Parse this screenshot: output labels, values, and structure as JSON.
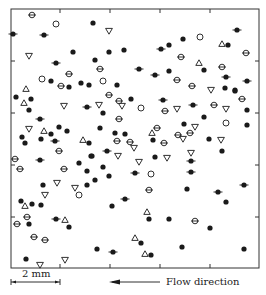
{
  "figure": {
    "scale_bar_label": "2 mm",
    "flow_label": "Flow direction",
    "legend": [
      {
        "marker": "filled-circle",
        "meaning": "filled dot"
      },
      {
        "marker": "filled-circle-dash",
        "meaning": "filled dot with horizontal dash"
      },
      {
        "marker": "circled-dot",
        "meaning": "circle with horizontal bar"
      },
      {
        "marker": "open-circle",
        "meaning": "open circle"
      },
      {
        "marker": "triangle-up",
        "meaning": "open upward triangle"
      },
      {
        "marker": "triangle-down",
        "meaning": "open downward triangle"
      }
    ],
    "colors": {
      "ink": "#1a1a1a",
      "frame": "#333333",
      "background": "#ffffff"
    }
  },
  "chart_data": {
    "type": "scatter",
    "title": "",
    "xlabel": "",
    "ylabel": "",
    "frame_px": {
      "left": 11,
      "top": 9,
      "right": 259,
      "bottom": 268
    },
    "x_ticks_px": [
      60,
      110,
      160,
      210
    ],
    "y_ticks_px": [
      61,
      113,
      165,
      217
    ],
    "grid": false,
    "scale": {
      "label": "2 mm",
      "x_start_px": 11,
      "x_end_px": 60
    },
    "annotation": {
      "text": "Flow direction",
      "arrow": "left"
    },
    "series": [
      {
        "name": "filled",
        "marker": "filled-circle",
        "points": [
          [
            93,
            23
          ],
          [
            73,
            52
          ],
          [
            51,
            81
          ],
          [
            69,
            87
          ],
          [
            81,
            83
          ],
          [
            89,
            85
          ],
          [
            109,
            52
          ],
          [
            124,
            50
          ],
          [
            169,
            45
          ],
          [
            95,
            60
          ],
          [
            169,
            71
          ],
          [
            117,
            85
          ],
          [
            183,
            39
          ],
          [
            228,
            45
          ],
          [
            204,
            70
          ],
          [
            225,
            88
          ],
          [
            235,
            90
          ],
          [
            16,
            97
          ],
          [
            31,
            99
          ],
          [
            29,
            110
          ],
          [
            59,
            127
          ],
          [
            67,
            131
          ],
          [
            51,
            134
          ],
          [
            22,
            137
          ],
          [
            41,
            139
          ],
          [
            25,
            143
          ],
          [
            89,
            143
          ],
          [
            91,
            156
          ],
          [
            79,
            163
          ],
          [
            87,
            171
          ],
          [
            131,
            99
          ],
          [
            103,
            113
          ],
          [
            100,
            128
          ],
          [
            115,
            133
          ],
          [
            125,
            134
          ],
          [
            153,
            140
          ],
          [
            92,
            156
          ],
          [
            155,
            157
          ],
          [
            103,
            167
          ],
          [
            109,
            176
          ],
          [
            235,
            91
          ],
          [
            247,
            110
          ],
          [
            204,
            117
          ],
          [
            184,
            124
          ],
          [
            247,
            125
          ],
          [
            209,
            139
          ],
          [
            222,
            151
          ],
          [
            43,
            185
          ],
          [
            87,
            185
          ],
          [
            21,
            201
          ],
          [
            32,
            204
          ],
          [
            41,
            205
          ],
          [
            29,
            224
          ],
          [
            69,
            227
          ],
          [
            26,
            259
          ],
          [
            95,
            180
          ],
          [
            112,
            206
          ],
          [
            149,
            219
          ],
          [
            169,
            219
          ],
          [
            141,
            243
          ],
          [
            97,
            249
          ],
          [
            151,
            255
          ],
          [
            187,
            189
          ],
          [
            226,
            202
          ],
          [
            210,
            228
          ],
          [
            182,
            247
          ],
          [
            244,
            249
          ]
        ]
      },
      {
        "name": "filled-dash",
        "marker": "filled-circle-dash",
        "points": [
          [
            13,
            34
          ],
          [
            44,
            35
          ],
          [
            56,
            63
          ],
          [
            161,
            49
          ],
          [
            139,
            69
          ],
          [
            155,
            75
          ],
          [
            237,
            30
          ],
          [
            226,
            77
          ],
          [
            247,
            81
          ],
          [
            87,
            107
          ],
          [
            40,
            119
          ],
          [
            55,
            141
          ],
          [
            40,
            160
          ],
          [
            163,
            100
          ],
          [
            107,
            151
          ],
          [
            135,
            173
          ],
          [
            193,
            105
          ],
          [
            191,
            161
          ],
          [
            191,
            172
          ],
          [
            56,
            219
          ],
          [
            125,
            199
          ],
          [
            113,
            252
          ],
          [
            244,
            185
          ],
          [
            218,
            192
          ]
        ]
      },
      {
        "name": "circled-dot",
        "marker": "circled-dot",
        "points": [
          [
            32,
            15
          ],
          [
            69,
            74
          ],
          [
            61,
            86
          ],
          [
            100,
            69
          ],
          [
            246,
            53
          ],
          [
            181,
            57
          ],
          [
            222,
            67
          ],
          [
            177,
            80
          ],
          [
            192,
            86
          ],
          [
            59,
            151
          ],
          [
            15,
            159
          ],
          [
            20,
            169
          ],
          [
            64,
            169
          ],
          [
            109,
            95
          ],
          [
            119,
            101
          ],
          [
            165,
            111
          ],
          [
            119,
            119
          ],
          [
            157,
            128
          ],
          [
            117,
            141
          ],
          [
            130,
            142
          ],
          [
            164,
            143
          ],
          [
            242,
            99
          ],
          [
            214,
            105
          ],
          [
            190,
            133
          ],
          [
            178,
            135
          ],
          [
            27,
            217
          ],
          [
            17,
            224
          ],
          [
            34,
            237
          ],
          [
            45,
            240
          ],
          [
            149,
            190
          ],
          [
            195,
            221
          ]
        ]
      },
      {
        "name": "open-circle",
        "marker": "open-circle",
        "points": [
          [
            56,
            24
          ],
          [
            42,
            79
          ],
          [
            103,
            81
          ],
          [
            200,
            37
          ],
          [
            141,
            108
          ],
          [
            151,
            174
          ],
          [
            226,
            123
          ],
          [
            79,
            195
          ]
        ]
      },
      {
        "name": "triangle-up",
        "marker": "triangle-up",
        "points": [
          [
            26,
            89
          ],
          [
            222,
            44
          ],
          [
            199,
            63
          ],
          [
            24,
            103
          ],
          [
            44,
            131
          ],
          [
            83,
            140
          ],
          [
            152,
            133
          ],
          [
            25,
            206
          ],
          [
            65,
            220
          ],
          [
            147,
            212
          ],
          [
            135,
            238
          ],
          [
            145,
            254
          ]
        ]
      },
      {
        "name": "triangle-down",
        "marker": "triangle-down",
        "points": [
          [
            29,
            56
          ],
          [
            109,
            31
          ],
          [
            211,
            90
          ],
          [
            64,
            106
          ],
          [
            29,
            129
          ],
          [
            99,
            105
          ],
          [
            122,
            106
          ],
          [
            134,
            148
          ],
          [
            118,
            156
          ],
          [
            167,
            158
          ],
          [
            139,
            162
          ],
          [
            177,
            109
          ],
          [
            226,
            109
          ],
          [
            195,
            127
          ],
          [
            183,
            139
          ],
          [
            221,
            140
          ],
          [
            191,
            153
          ],
          [
            57,
            183
          ],
          [
            75,
            188
          ],
          [
            45,
            195
          ],
          [
            40,
            265
          ],
          [
            65,
            260
          ]
        ]
      }
    ]
  }
}
